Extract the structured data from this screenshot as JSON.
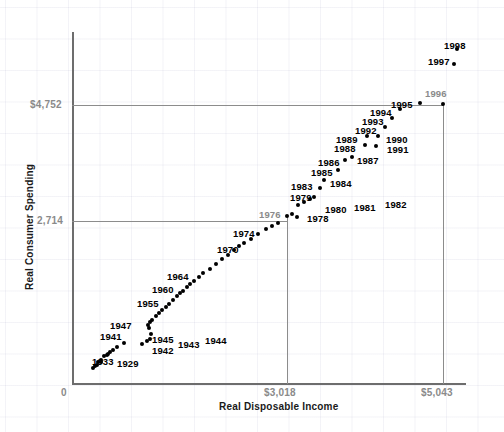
{
  "chart_data": {
    "type": "scatter",
    "title": "",
    "xlabel": "Real Disposable Income",
    "ylabel": "Real Consumer Spending",
    "xlim": [
      0,
      5700
    ],
    "ylim": [
      0,
      6200
    ],
    "grid": true,
    "legend": "none",
    "x_tick_labels": [
      "0",
      "$3,018",
      "$5,043"
    ],
    "y_tick_labels": [
      "0",
      "2,714",
      "$4,752"
    ],
    "x_reference_values": [
      3018,
      5043
    ],
    "y_reference_values": [
      2714,
      4752
    ],
    "origin_label": "0",
    "point_color": "#000000",
    "axis_color": "#6d6d6d",
    "reference_line_color": "#8c8c8c",
    "tick_label_color": "#8a8a8a",
    "points": [
      {
        "label": "1929",
        "x": 1089,
        "y": 982,
        "px": 104,
        "py": 356,
        "lx": 117,
        "ly": 358,
        "muted": false,
        "labeled": true
      },
      {
        "label": "1930",
        "x": 1000,
        "y": 920,
        "px": 101,
        "py": 360,
        "muted": false,
        "labeled": false
      },
      {
        "label": "1931",
        "x": 943,
        "y": 897,
        "px": 98,
        "py": 362,
        "muted": false,
        "labeled": false
      },
      {
        "label": "1932",
        "x": 880,
        "y": 832,
        "px": 95,
        "py": 366,
        "muted": false,
        "labeled": false
      },
      {
        "label": "1933",
        "x": 858,
        "y": 818,
        "px": 93,
        "py": 368,
        "lx": 92,
        "ly": 356,
        "muted": false,
        "labeled": true
      },
      {
        "label": "1934",
        "x": 907,
        "y": 852,
        "px": 97,
        "py": 365,
        "muted": false,
        "labeled": false
      },
      {
        "label": "1935",
        "x": 980,
        "y": 900,
        "px": 101,
        "py": 362,
        "muted": false,
        "labeled": false
      },
      {
        "label": "1936",
        "x": 1098,
        "y": 988,
        "px": 107,
        "py": 355,
        "muted": false,
        "labeled": false
      },
      {
        "label": "1937",
        "x": 1142,
        "y": 1023,
        "px": 110,
        "py": 352,
        "muted": false,
        "labeled": false
      },
      {
        "label": "1938",
        "x": 1093,
        "y": 1000,
        "px": 108,
        "py": 354,
        "muted": false,
        "labeled": false
      },
      {
        "label": "1939",
        "x": 1178,
        "y": 1055,
        "px": 113,
        "py": 350,
        "muted": false,
        "labeled": false
      },
      {
        "label": "1940",
        "x": 1254,
        "y": 1105,
        "px": 117,
        "py": 347,
        "muted": false,
        "labeled": false
      },
      {
        "label": "1941",
        "x": 1384,
        "y": 1165,
        "px": 124,
        "py": 343,
        "lx": 100,
        "ly": 331,
        "muted": false,
        "labeled": true
      },
      {
        "label": "1942",
        "x": 1513,
        "y": 1149,
        "px": 142,
        "py": 344,
        "lx": 152,
        "ly": 345,
        "muted": false,
        "labeled": true
      },
      {
        "label": "1943",
        "x": 1551,
        "y": 1198,
        "px": 147,
        "py": 341,
        "lx": 178,
        "ly": 339,
        "muted": false,
        "labeled": true
      },
      {
        "label": "1944",
        "x": 1606,
        "y": 1218,
        "px": 150,
        "py": 339,
        "lx": 205,
        "ly": 335,
        "muted": false,
        "labeled": true
      },
      {
        "label": "1945",
        "x": 1610,
        "y": 1311,
        "px": 151,
        "py": 334,
        "lx": 152,
        "ly": 334,
        "muted": false,
        "labeled": true
      },
      {
        "label": "1946",
        "x": 1512,
        "y": 1442,
        "px": 149,
        "py": 328,
        "muted": false,
        "labeled": false
      },
      {
        "label": "1947",
        "x": 1448,
        "y": 1448,
        "px": 148,
        "py": 325,
        "lx": 110,
        "ly": 320,
        "muted": false,
        "labeled": true
      },
      {
        "label": "1948",
        "x": 1490,
        "y": 1462,
        "px": 150,
        "py": 322,
        "muted": false,
        "labeled": false
      },
      {
        "label": "1949",
        "x": 1494,
        "y": 1492,
        "px": 152,
        "py": 320,
        "muted": false,
        "labeled": false
      },
      {
        "label": "1950",
        "x": 1596,
        "y": 1590,
        "px": 156,
        "py": 316,
        "muted": false,
        "labeled": false
      },
      {
        "label": "1951",
        "x": 1636,
        "y": 1606,
        "px": 159,
        "py": 313,
        "muted": false,
        "labeled": false
      },
      {
        "label": "1952",
        "x": 1673,
        "y": 1648,
        "px": 162,
        "py": 310,
        "muted": false,
        "labeled": false
      },
      {
        "label": "1953",
        "x": 1740,
        "y": 1704,
        "px": 166,
        "py": 307,
        "muted": false,
        "labeled": false
      },
      {
        "label": "1954",
        "x": 1759,
        "y": 1727,
        "px": 169,
        "py": 304,
        "muted": false,
        "labeled": false
      },
      {
        "label": "1955",
        "x": 1844,
        "y": 1815,
        "px": 173,
        "py": 300,
        "lx": 137,
        "ly": 298,
        "muted": false,
        "labeled": true
      },
      {
        "label": "1956",
        "x": 1895,
        "y": 1867,
        "px": 177,
        "py": 296,
        "muted": false,
        "labeled": false
      },
      {
        "label": "1957",
        "x": 1929,
        "y": 1893,
        "px": 180,
        "py": 293,
        "muted": false,
        "labeled": false
      },
      {
        "label": "1958",
        "x": 1935,
        "y": 1900,
        "px": 183,
        "py": 291,
        "muted": false,
        "labeled": false
      },
      {
        "label": "1959",
        "x": 2001,
        "y": 1974,
        "px": 187,
        "py": 287,
        "muted": false,
        "labeled": false
      },
      {
        "label": "1960",
        "x": 2032,
        "y": 2009,
        "px": 190,
        "py": 284,
        "lx": 152,
        "ly": 284,
        "muted": false,
        "labeled": true
      },
      {
        "label": "1961",
        "x": 2074,
        "y": 2035,
        "px": 194,
        "py": 281,
        "muted": false,
        "labeled": false
      },
      {
        "label": "1962",
        "x": 2157,
        "y": 2113,
        "px": 199,
        "py": 277,
        "muted": false,
        "labeled": false
      },
      {
        "label": "1963",
        "x": 2208,
        "y": 2181,
        "px": 203,
        "py": 273,
        "muted": false,
        "labeled": false
      },
      {
        "label": "1964",
        "x": 2340,
        "y": 2303,
        "px": 210,
        "py": 269,
        "lx": 167,
        "ly": 271,
        "muted": false,
        "labeled": true
      },
      {
        "label": "1965",
        "x": 2448,
        "y": 2431,
        "px": 216,
        "py": 264,
        "muted": false,
        "labeled": false
      },
      {
        "label": "1966",
        "x": 2545,
        "y": 2549,
        "px": 222,
        "py": 259,
        "muted": false,
        "labeled": false
      },
      {
        "label": "1967",
        "x": 2640,
        "y": 2614,
        "px": 228,
        "py": 255,
        "muted": false,
        "labeled": false
      },
      {
        "label": "1968",
        "x": 2709,
        "y": 2737,
        "px": 234,
        "py": 250,
        "muted": false,
        "labeled": false
      },
      {
        "label": "1969",
        "x": 2773,
        "y": 2818,
        "px": 239,
        "py": 246,
        "muted": false,
        "labeled": false
      },
      {
        "label": "1970",
        "x": 2875,
        "y": 2868,
        "px": 244,
        "py": 243,
        "lx": 217,
        "ly": 244,
        "muted": false,
        "labeled": true
      },
      {
        "label": "1971",
        "x": 2967,
        "y": 2961,
        "px": 251,
        "py": 239,
        "muted": false,
        "labeled": false
      },
      {
        "label": "1972",
        "x": 3083,
        "y": 3128,
        "px": 258,
        "py": 234,
        "muted": false,
        "labeled": false
      },
      {
        "label": "1973",
        "x": 3273,
        "y": 3248,
        "px": 266,
        "py": 229,
        "muted": false,
        "labeled": false
      },
      {
        "label": "1974",
        "x": 3229,
        "y": 3209,
        "px": 272,
        "py": 226,
        "lx": 233,
        "ly": 228,
        "muted": false,
        "labeled": true
      },
      {
        "label": "1975",
        "x": 3261,
        "y": 3260,
        "px": 278,
        "py": 223,
        "muted": false,
        "labeled": false
      },
      {
        "label": "1976",
        "x": 3363,
        "y": 3398,
        "px": 287,
        "py": 216,
        "lx": 259,
        "ly": 209,
        "muted": true,
        "labeled": true
      },
      {
        "label": "1977",
        "x": 3447,
        "y": 3500,
        "px": 292,
        "py": 214,
        "muted": false,
        "labeled": false
      },
      {
        "label": "1978",
        "x": 3577,
        "y": 3636,
        "px": 297,
        "py": 217,
        "lx": 307,
        "ly": 213,
        "muted": false,
        "labeled": true
      },
      {
        "label": "1979",
        "x": 3631,
        "y": 3692,
        "px": 298,
        "py": 205,
        "lx": 290,
        "ly": 192,
        "muted": false,
        "labeled": true
      },
      {
        "label": "1980",
        "x": 3658,
        "y": 3668,
        "px": 304,
        "py": 202,
        "lx": 325,
        "ly": 204,
        "muted": false,
        "labeled": true
      },
      {
        "label": "1981",
        "x": 3741,
        "y": 3713,
        "px": 310,
        "py": 199,
        "lx": 354,
        "ly": 202,
        "muted": false,
        "labeled": true
      },
      {
        "label": "1982",
        "x": 3791,
        "y": 3756,
        "px": 314,
        "py": 197,
        "lx": 385,
        "ly": 199,
        "muted": false,
        "labeled": true
      },
      {
        "label": "1983",
        "x": 3906,
        "y": 3927,
        "px": 320,
        "py": 188,
        "lx": 291,
        "ly": 181,
        "muted": false,
        "labeled": true
      },
      {
        "label": "1984",
        "x": 4172,
        "y": 4074,
        "px": 324,
        "py": 180,
        "lx": 330,
        "ly": 178,
        "muted": false,
        "labeled": true
      },
      {
        "label": "1985",
        "x": 4265,
        "y": 4260,
        "px": 338,
        "py": 170,
        "lx": 311,
        "ly": 167,
        "muted": false,
        "labeled": true
      },
      {
        "label": "1986",
        "x": 4386,
        "y": 4392,
        "px": 345,
        "py": 160,
        "lx": 318,
        "ly": 157,
        "muted": false,
        "labeled": true
      },
      {
        "label": "1987",
        "x": 4418,
        "y": 4507,
        "px": 352,
        "py": 157,
        "lx": 357,
        "ly": 155,
        "muted": false,
        "labeled": true
      },
      {
        "label": "1988",
        "x": 4571,
        "y": 4650,
        "px": 365,
        "py": 145,
        "lx": 334,
        "ly": 143,
        "muted": false,
        "labeled": true
      },
      {
        "label": "1989",
        "x": 4657,
        "y": 4722,
        "px": 367,
        "py": 136,
        "lx": 336,
        "ly": 134,
        "muted": false,
        "labeled": true
      },
      {
        "label": "1990",
        "x": 4718,
        "y": 4770,
        "px": 378,
        "py": 136,
        "lx": 386,
        "ly": 134,
        "muted": false,
        "labeled": true
      },
      {
        "label": "1991",
        "x": 4715,
        "y": 4778,
        "px": 376,
        "py": 146,
        "lx": 387,
        "ly": 144,
        "muted": false,
        "labeled": true
      },
      {
        "label": "1992",
        "x": 4802,
        "y": 4805,
        "px": 385,
        "py": 127,
        "lx": 355,
        "ly": 125,
        "muted": false,
        "labeled": true
      },
      {
        "label": "1993",
        "x": 4843,
        "y": 4958,
        "px": 392,
        "py": 118,
        "lx": 362,
        "ly": 116,
        "muted": false,
        "labeled": true
      },
      {
        "label": "1994",
        "x": 4932,
        "y": 5076,
        "px": 400,
        "py": 109,
        "lx": 370,
        "ly": 107,
        "muted": false,
        "labeled": true
      },
      {
        "label": "1995",
        "x": 5008,
        "y": 5172,
        "px": 420,
        "py": 103,
        "lx": 391,
        "ly": 99,
        "muted": false,
        "labeled": true
      },
      {
        "label": "1996",
        "x": 5043,
        "y": 4752,
        "px": 443,
        "py": 104,
        "lx": 425,
        "ly": 88,
        "muted": true,
        "labeled": true
      },
      {
        "label": "1997",
        "x": 5353,
        "y": 5500,
        "px": 454,
        "py": 64,
        "lx": 428,
        "ly": 56,
        "muted": false,
        "labeled": true
      },
      {
        "label": "1998",
        "x": 5490,
        "y": 5700,
        "px": 457,
        "py": 49,
        "lx": 444,
        "ly": 40,
        "muted": false,
        "labeled": true
      }
    ]
  },
  "axes": {
    "y_axis": {
      "x": 72,
      "top": 32,
      "bottom": 383
    },
    "x_axis": {
      "y": 383,
      "left": 72,
      "right": 466
    },
    "origin_label": "0",
    "origin_label_x": 60,
    "origin_label_y": 387,
    "y_ticks": [
      {
        "label": "$4,752",
        "y": 105,
        "line_to_x": 443
      },
      {
        "label": "2,714",
        "y": 221,
        "line_to_x": 287
      }
    ],
    "x_ticks": [
      {
        "label": "$3,018",
        "x": 287,
        "line_to_y": 216
      },
      {
        "label": "$5,043",
        "x": 443,
        "line_to_y": 104
      }
    ]
  }
}
